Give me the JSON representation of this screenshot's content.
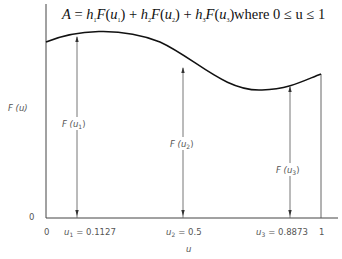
{
  "equation": {
    "lhs": "A",
    "terms": [
      {
        "coef": "h",
        "coef_sub": "1",
        "func": "F",
        "arg": "u",
        "arg_sub": "1"
      },
      {
        "coef": "h",
        "coef_sub": "2",
        "func": "F",
        "arg": "u",
        "arg_sub": "2"
      },
      {
        "coef": "h",
        "coef_sub": "3",
        "func": "F",
        "arg": "u",
        "arg_sub": "3"
      }
    ],
    "condition": "where 0 ≤ u ≤ 1"
  },
  "axes": {
    "y_label": "F (u)",
    "y_zero": "0",
    "x_label": "u",
    "x_zero": "0",
    "x_one": "1"
  },
  "sample_points": [
    {
      "label": "u",
      "sub": "1",
      "value": "= 0.1127",
      "ordinate": "F (u",
      "ordinate_sub": "1",
      "ordinate_close": ")"
    },
    {
      "label": "u",
      "sub": "2",
      "value": "= 0.5",
      "ordinate": "F (u",
      "ordinate_sub": "2",
      "ordinate_close": ")"
    },
    {
      "label": "u",
      "sub": "3",
      "value": "= 0.8873",
      "ordinate": "F (u",
      "ordinate_sub": "3",
      "ordinate_close": ")"
    }
  ],
  "colors": {
    "curve": "#111111",
    "axis": "#444444",
    "ordinate_lines": "#666666"
  }
}
